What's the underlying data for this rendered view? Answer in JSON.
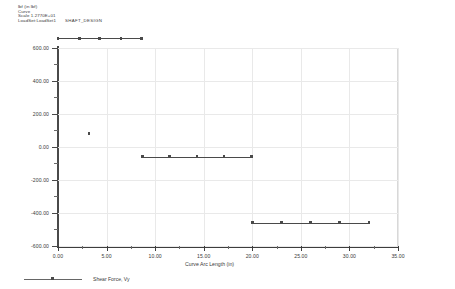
{
  "header": {
    "line1": "lbf  (in lbf)",
    "line2": "Curve",
    "line3": "Scale 1.2770E+01",
    "line4": "LoadSet:LoadSet1",
    "design_name": "SHAFT_DESIGN"
  },
  "legend": {
    "label": "Shear Force, Vy"
  },
  "chart_data": {
    "type": "line",
    "title": "",
    "xlabel": "Curve Arc Length (in)",
    "ylabel": "Shear Force, Vy",
    "xlim": [
      0,
      35
    ],
    "ylim": [
      -600,
      600
    ],
    "xticks": [
      0,
      5,
      10,
      15,
      20,
      25,
      30,
      35
    ],
    "xticklabels": [
      "0.00",
      "5.00",
      "10.00",
      "15.00",
      "20.00",
      "25.00",
      "30.00",
      "35.00"
    ],
    "yticks": [
      -600,
      -400,
      -200,
      0,
      200,
      400,
      600
    ],
    "yticklabels": [
      "-600.00",
      "-400.00",
      "-200.00",
      "0.00",
      "200.00",
      "400.00",
      "600.00"
    ],
    "grid": true,
    "legend_position": "below",
    "marker": "square",
    "series": [
      {
        "name": "Shear Force, Vy",
        "color": "#4a4a4a",
        "segments": [
          {
            "x": [
              0.0,
              2.2,
              4.3,
              6.5,
              8.6
            ],
            "y": [
              655,
              655,
              655,
              655,
              655
            ]
          },
          {
            "x": [
              8.7,
              11.5,
              14.3,
              17.1,
              19.9
            ],
            "y": [
              -62,
              -62,
              -62,
              -62,
              -62
            ]
          },
          {
            "x": [
              20.0,
              23.0,
              26.0,
              29.0,
              32.0
            ],
            "y": [
              -462,
              -462,
              -462,
              -462,
              -462
            ]
          }
        ],
        "isolated_points": [
          {
            "x": 3.2,
            "y": 78
          }
        ]
      }
    ]
  }
}
